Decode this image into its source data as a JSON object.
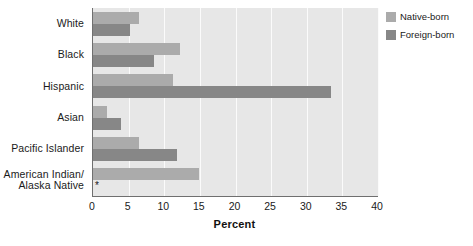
{
  "chart_data": {
    "type": "bar",
    "orientation": "horizontal",
    "title": "",
    "xlabel": "Percent",
    "ylabel": "",
    "xlim": [
      0,
      40
    ],
    "xticks": [
      0,
      5,
      10,
      15,
      20,
      25,
      30,
      35,
      40
    ],
    "grid": true,
    "grid_axis": "x",
    "legend_position": "right",
    "categories": [
      "White",
      "Black",
      "Hispanic",
      "Asian",
      "Pacific Islander",
      "American Indian/\nAlaska Native"
    ],
    "series": [
      {
        "name": "Native-born",
        "color": "#ababab",
        "values": [
          6.4,
          12.2,
          11.2,
          2.0,
          6.4,
          14.9
        ]
      },
      {
        "name": "Foreign-born",
        "color": "#878787",
        "values": [
          5.2,
          8.6,
          33.4,
          3.9,
          11.8,
          null
        ]
      }
    ],
    "annotations": [
      {
        "text": "*",
        "category": "American Indian/\nAlaska Native",
        "series": "Foreign-born",
        "meaning": "value suppressed / not available"
      }
    ]
  },
  "legend": {
    "items": [
      {
        "label": "Native-born",
        "color": "#ababab"
      },
      {
        "label": "Foreign-born",
        "color": "#878787"
      }
    ]
  },
  "axis": {
    "x_title": "Percent",
    "x_tick_labels": [
      "0",
      "5",
      "10",
      "15",
      "20",
      "25",
      "30",
      "35",
      "40"
    ]
  },
  "colors": {
    "native_born": "#ababab",
    "foreign_born": "#878787",
    "plot_background": "#e7e7e7",
    "gridline": "#fbfbfb",
    "axis_line": "#6f6f6f",
    "text": "#1a1a1a"
  }
}
